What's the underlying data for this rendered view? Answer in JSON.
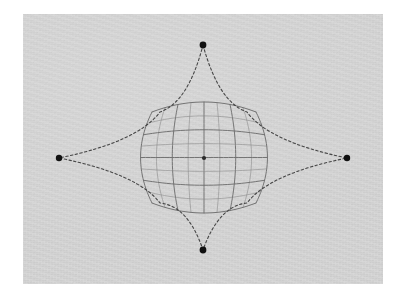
{
  "figure": {
    "kind": "geometry-diagram",
    "caption": "",
    "canvas": {
      "width": 406,
      "height": 298,
      "background": "#ffffff"
    },
    "panel": {
      "x": 23,
      "y": 14,
      "width": 360,
      "height": 270,
      "fill": "#d7d7d7",
      "border": "none",
      "texture": "scanned-paper-grain"
    }
  },
  "style": {
    "vertex_color": "#111111",
    "curve_color": "#3a3a3a",
    "grid_color": "#8a8a8a",
    "grid_color_major": "#6f6f6f",
    "center_point_color": "#2b2b2b",
    "curve_dash": "2.4 2.4",
    "curve_width": 1.1,
    "grid_width": 0.75
  },
  "chart_data": {
    "type": "scatter",
    "title": "",
    "xlabel": "",
    "ylabel": "",
    "grid": false,
    "legend": "none",
    "vertices": [
      {
        "name": "top-vertex",
        "label": "",
        "x": 203,
        "y": 45,
        "radius": 3.4
      },
      {
        "name": "left-vertex",
        "label": "",
        "x": 59,
        "y": 158,
        "radius": 3.2
      },
      {
        "name": "right-vertex",
        "label": "",
        "x": 347,
        "y": 158,
        "radius": 3.2
      },
      {
        "name": "bottom-vertex",
        "label": "",
        "x": 203,
        "y": 250,
        "radius": 3.4
      }
    ],
    "center_point": {
      "name": "center-marker",
      "label": "",
      "x": 204,
      "y": 158,
      "radius": 2.1
    }
  },
  "star_curve": {
    "name": "four-point-star-dashed-curve",
    "description": "concave four-pointed star (astroid-like) dashed outline through the four vertices",
    "cusps": [
      {
        "x": 247,
        "y": 112
      },
      {
        "x": 247,
        "y": 203
      },
      {
        "x": 160,
        "y": 203
      },
      {
        "x": 160,
        "y": 112
      }
    ],
    "dashed": true
  },
  "mesh": {
    "name": "spherical-grid-mesh",
    "description": "barrel-distorted square grid representing a sphere / curved surface",
    "bounds": {
      "left": 152,
      "top": 112,
      "right": 256,
      "bottom": 203
    },
    "columns": 8,
    "rows": 8,
    "bulge": 0.22,
    "emphasized_lines": [
      2,
      4,
      6
    ]
  },
  "accessibility": {
    "alt": "Light gray panel showing a dashed four-pointed star curve with black dots at its four tips and a barrel-distorted square grid mesh at the center with a small center dot."
  }
}
